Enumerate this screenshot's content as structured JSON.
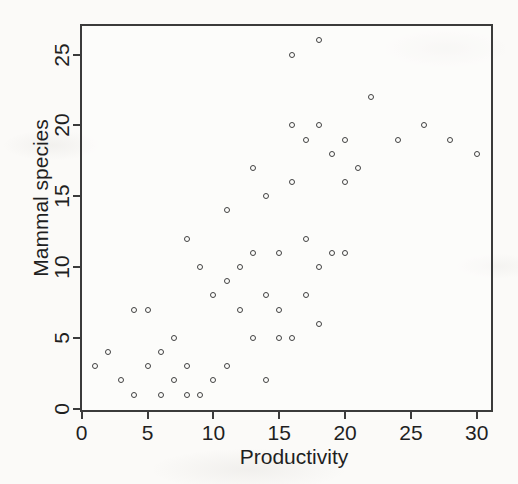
{
  "chart_data": {
    "type": "scatter",
    "title": "",
    "xlabel": "Productivity",
    "ylabel": "Mammal species",
    "x_ticks": [
      0,
      5,
      10,
      15,
      20,
      25,
      30
    ],
    "y_ticks": [
      0,
      5,
      10,
      15,
      20,
      25
    ],
    "xlim": [
      0,
      31.2
    ],
    "ylim": [
      0,
      27.2
    ],
    "grid": false,
    "legend": "none",
    "marker": "open-circle",
    "colors": {
      "frame": "#3b3b3b",
      "marker": "#414141",
      "text": "#1f1f1f",
      "paper": "#fbfaf8"
    },
    "points": [
      [
        1,
        3
      ],
      [
        2,
        4
      ],
      [
        3,
        2
      ],
      [
        4,
        1
      ],
      [
        4,
        7
      ],
      [
        5,
        3
      ],
      [
        5,
        7
      ],
      [
        6,
        1
      ],
      [
        6,
        4
      ],
      [
        7,
        2
      ],
      [
        7,
        5
      ],
      [
        8,
        1
      ],
      [
        8,
        3
      ],
      [
        8,
        12
      ],
      [
        9,
        1
      ],
      [
        9,
        10
      ],
      [
        10,
        2
      ],
      [
        10,
        8
      ],
      [
        11,
        3
      ],
      [
        11,
        9
      ],
      [
        11,
        14
      ],
      [
        12,
        7
      ],
      [
        12,
        10
      ],
      [
        13,
        5
      ],
      [
        13,
        11
      ],
      [
        13,
        17
      ],
      [
        14,
        2
      ],
      [
        14,
        8
      ],
      [
        14,
        15
      ],
      [
        15,
        5
      ],
      [
        15,
        7
      ],
      [
        15,
        11
      ],
      [
        16,
        5
      ],
      [
        16,
        16
      ],
      [
        16,
        20
      ],
      [
        16,
        25
      ],
      [
        17,
        8
      ],
      [
        17,
        12
      ],
      [
        17,
        19
      ],
      [
        18,
        6
      ],
      [
        18,
        10
      ],
      [
        18,
        20
      ],
      [
        18,
        26
      ],
      [
        19,
        11
      ],
      [
        19,
        18
      ],
      [
        20,
        11
      ],
      [
        20,
        16
      ],
      [
        20,
        19
      ],
      [
        21,
        17
      ],
      [
        22,
        22
      ],
      [
        24,
        19
      ],
      [
        26,
        20
      ],
      [
        28,
        19
      ],
      [
        30,
        18
      ]
    ]
  }
}
